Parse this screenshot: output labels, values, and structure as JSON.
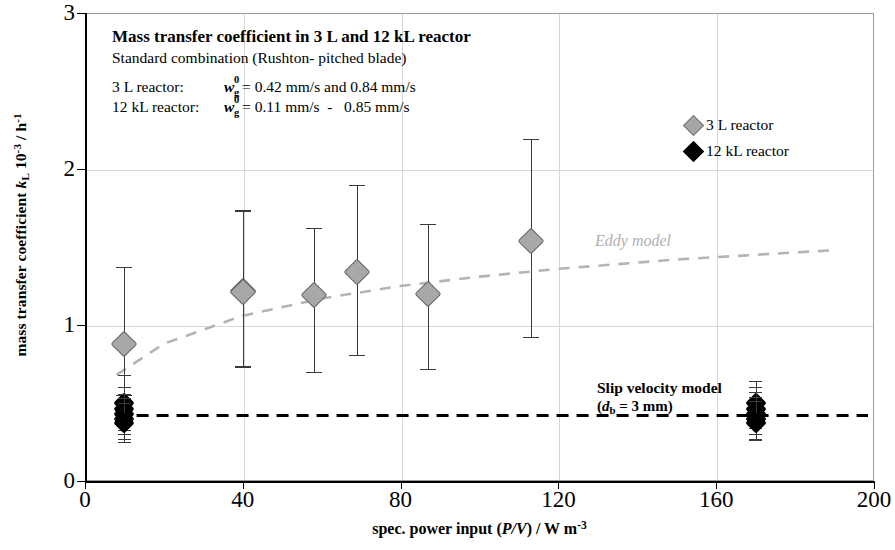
{
  "title": {
    "main": "Mass transfer coefficient in 3 L and 12 kL reactor",
    "sub": "Standard combination (Rushton- pitched blade)"
  },
  "conditions": [
    {
      "label": "3 L reactor:",
      "symbol": "w",
      "sup": "0",
      "subscript": "g",
      "value": "= 0.42 mm/s and 0.84 mm/s"
    },
    {
      "label": "12 kL reactor:",
      "symbol": "w",
      "sup": "0",
      "subscript": "g",
      "value": "= 0.11 mm/s  -   0.85 mm/s"
    }
  ],
  "legend": {
    "items": [
      {
        "label": "3 L reactor",
        "marker": "grey-diamond",
        "color": "#a6a6a6"
      },
      {
        "label": "12 kL reactor",
        "marker": "black-diamond",
        "color": "#000000"
      }
    ]
  },
  "annotations": {
    "eddy": {
      "text": "Eddy model",
      "color": "#b0b0b0"
    },
    "slip_line1": "Slip velocity model",
    "slip_line2_pre": "(",
    "slip_line2_sym": "d",
    "slip_line2_sub": "b",
    "slip_line2_post": " = 3 mm)"
  },
  "axes": {
    "x": {
      "title_pre": "spec. power input (",
      "title_ital": "P/V",
      "title_mid": ") / W m",
      "title_sup": "-3",
      "ticks": [
        "0",
        "40",
        "80",
        "120",
        "160",
        "200"
      ],
      "tick_values": [
        0,
        40,
        80,
        120,
        160,
        200
      ],
      "min": 0,
      "max": 200
    },
    "y": {
      "title_pre": "mass transfer coefficient ",
      "title_ital": "k",
      "title_sub": "L",
      "title_mid": " 10",
      "title_sup1": "-3",
      "title_mid2": " / h",
      "title_sup2": "-1",
      "ticks": [
        "0",
        "1",
        "2",
        "3"
      ],
      "tick_values": [
        0,
        1,
        2,
        3
      ],
      "min": 0,
      "max": 3
    }
  },
  "chart_data": {
    "type": "scatter",
    "title": "Mass transfer coefficient in 3 L and 12 kL reactor",
    "subtitle": "Standard combination (Rushton- pitched blade)",
    "xlabel": "spec. power input (P/V) / W m^-3",
    "ylabel": "mass transfer coefficient k_L 10^-3 / h^-1",
    "xlim": [
      0,
      200
    ],
    "ylim": [
      0,
      3
    ],
    "xticks": [
      0,
      40,
      80,
      120,
      160,
      200
    ],
    "yticks": [
      0,
      1,
      2,
      3
    ],
    "grid": true,
    "legend_position": "top-right",
    "series": [
      {
        "name": "3 L reactor",
        "marker": "diamond",
        "color": "#a8a8a8",
        "marker_size": 17,
        "points": [
          {
            "x": 10,
            "y": 0.88,
            "ylow": 0.55,
            "yhigh": 1.37
          },
          {
            "x": 40,
            "y": 1.22,
            "ylow": 0.73,
            "yhigh": 1.74
          },
          {
            "x": 40,
            "y": 1.21,
            "ylow": 0.74,
            "yhigh": 1.73
          },
          {
            "x": 58,
            "y": 1.19,
            "ylow": 0.7,
            "yhigh": 1.62
          },
          {
            "x": 69,
            "y": 1.34,
            "ylow": 0.81,
            "yhigh": 1.9
          },
          {
            "x": 87,
            "y": 1.2,
            "ylow": 0.72,
            "yhigh": 1.65
          },
          {
            "x": 113,
            "y": 1.54,
            "ylow": 0.92,
            "yhigh": 2.19
          }
        ]
      },
      {
        "name": "12 kL reactor",
        "marker": "diamond",
        "color": "#000000",
        "marker_size": 13,
        "points": [
          {
            "x": 10,
            "y": 0.5,
            "ylow": 0.4,
            "yhigh": 0.68
          },
          {
            "x": 10,
            "y": 0.46,
            "ylow": 0.33,
            "yhigh": 0.6
          },
          {
            "x": 10,
            "y": 0.43,
            "ylow": 0.3,
            "yhigh": 0.56
          },
          {
            "x": 10,
            "y": 0.4,
            "ylow": 0.27,
            "yhigh": 0.53
          },
          {
            "x": 10,
            "y": 0.37,
            "ylow": 0.25,
            "yhigh": 0.5
          },
          {
            "x": 170,
            "y": 0.5,
            "ylow": 0.38,
            "yhigh": 0.64
          },
          {
            "x": 170,
            "y": 0.46,
            "ylow": 0.34,
            "yhigh": 0.6
          },
          {
            "x": 170,
            "y": 0.43,
            "ylow": 0.3,
            "yhigh": 0.57
          },
          {
            "x": 170,
            "y": 0.4,
            "ylow": 0.27,
            "yhigh": 0.54
          },
          {
            "x": 170,
            "y": 0.37,
            "ylow": 0.26,
            "yhigh": 0.51
          }
        ]
      }
    ],
    "model_curves": [
      {
        "name": "Eddy model",
        "style": "dashed",
        "color": "#b4b4b4",
        "points": [
          {
            "x": 8,
            "y": 0.68
          },
          {
            "x": 20,
            "y": 0.88
          },
          {
            "x": 40,
            "y": 1.06
          },
          {
            "x": 60,
            "y": 1.17
          },
          {
            "x": 80,
            "y": 1.25
          },
          {
            "x": 100,
            "y": 1.31
          },
          {
            "x": 120,
            "y": 1.36
          },
          {
            "x": 150,
            "y": 1.42
          },
          {
            "x": 190,
            "y": 1.48
          }
        ]
      },
      {
        "name": "Slip velocity model (d_b = 3 mm)",
        "style": "dashed",
        "color": "#000000",
        "constant_y": 0.42,
        "x_from": 8,
        "x_to": 790
      }
    ]
  }
}
